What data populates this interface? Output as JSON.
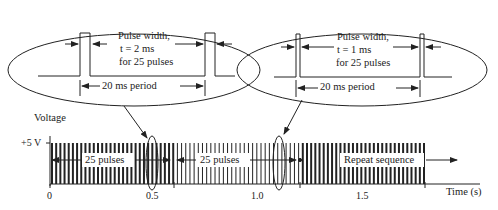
{
  "diagram": {
    "type": "pwm-pulse-train",
    "y_axis": {
      "label": "Voltage",
      "level_label": "+5 V"
    },
    "x_axis": {
      "label": "Time (s)",
      "ticks": [
        "0",
        "0.5",
        "1.0",
        "1.5"
      ]
    },
    "segments": [
      {
        "label": "25 pulses",
        "pulse_width_ms": 2
      },
      {
        "label": "25 pulses",
        "pulse_width_ms": 1
      },
      {
        "label": "Repeat sequence",
        "pulse_width_ms": 2
      }
    ],
    "callouts": [
      {
        "title": "Pulse width,",
        "value": "t = 2 ms",
        "detail": "for 25 pulses",
        "period": "20 ms period"
      },
      {
        "title": "Pulse width,",
        "value": "t = 1 ms",
        "detail": "for 25 pulses",
        "period": "20 ms period"
      }
    ],
    "colors": {
      "line": "#222222",
      "background": "#ffffff"
    }
  }
}
